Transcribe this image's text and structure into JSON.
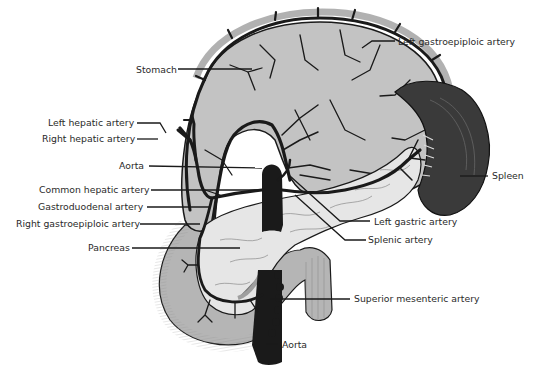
{
  "figure": {
    "type": "anatomical illustration",
    "colors": {
      "organ_fill": "#b9b9b9",
      "pancreas_fill": "#e4e4e4",
      "spleen_fill": "#3a3a3a",
      "vessel": "#1a1a1a",
      "text": "#2a2a2a",
      "background": "#ffffff"
    }
  },
  "labels": {
    "stomach": "Stomach",
    "left_gastroepiploic_artery": "Left gastroepiploic artery",
    "left_hepatic_artery": "Left hepatic artery",
    "right_hepatic_artery": "Right hepatic artery",
    "aorta_upper": "Aorta",
    "spleen": "Spleen",
    "common_hepatic_artery": "Common hepatic artery",
    "gastroduodenal_artery": "Gastroduodenal artery",
    "right_gastroepiploic_artery": "Right gastroepiploic artery",
    "left_gastric_artery": "Left gastric artery",
    "splenic_artery": "Splenic artery",
    "pancreas": "Pancreas",
    "superior_mesenteric_artery": "Superior mesenteric artery",
    "aorta_lower": "Aorta"
  }
}
